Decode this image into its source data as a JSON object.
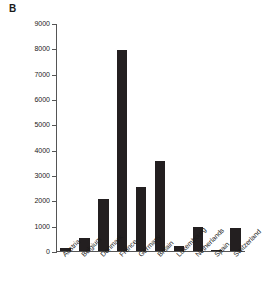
{
  "figure": {
    "panel_label": "B",
    "background_color": "#ffffff",
    "bar_color": "#231f20",
    "axis_color": "#555555"
  },
  "chart_data": {
    "type": "bar",
    "title": "",
    "subtitle": "",
    "xlabel": "",
    "ylabel": "Insured losses (Euro millions)",
    "categories": [
      "Austria",
      "Belgium",
      "Denmark",
      "France",
      "Germany",
      "Britain",
      "Luxembourg",
      "Netherlands",
      "Spain",
      "Switzerland"
    ],
    "values": [
      110,
      520,
      2050,
      7950,
      2540,
      3570,
      200,
      930,
      50,
      910
    ],
    "ylim": [
      0,
      9000
    ],
    "ytick_values": [
      0,
      1000,
      2000,
      3000,
      4000,
      5000,
      6000,
      7000,
      8000,
      9000
    ],
    "ytick_labels": [
      "0",
      "1000",
      "2000",
      "3000",
      "4000",
      "5000",
      "6000",
      "7000",
      "8000",
      "9000"
    ],
    "grid": false,
    "legend": null,
    "legend_position": "none",
    "annotations": [
      "B"
    ]
  }
}
